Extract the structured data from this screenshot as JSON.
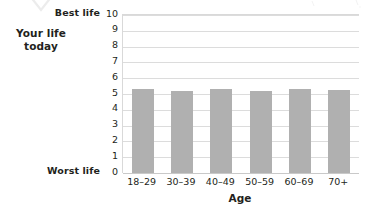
{
  "chart_data": {
    "type": "bar",
    "title": "",
    "categories": [
      "18–29",
      "30–39",
      "40–49",
      "50–59",
      "60–69",
      "70+"
    ],
    "values": [
      5.3,
      5.2,
      5.3,
      5.2,
      5.3,
      5.25
    ],
    "series": [
      {
        "name": "Your life today",
        "values": [
          5.3,
          5.2,
          5.3,
          5.2,
          5.3,
          5.25
        ]
      }
    ],
    "xlabel": "Age",
    "ylabel": "Your life today",
    "ylim": [
      0,
      10
    ],
    "ytick_labels": [
      "10",
      "9",
      "8",
      "7",
      "6",
      "5",
      "4",
      "3",
      "2",
      "1",
      "0"
    ],
    "ytick_values": [
      10,
      9,
      8,
      7,
      6,
      5,
      4,
      3,
      2,
      1,
      0
    ],
    "y_top_annotation": "Best life",
    "y_bottom_annotation": "Worst life",
    "grid": true,
    "legend": "none",
    "bar_color": "#b0b0b0",
    "grid_color": "#dcdcdc"
  },
  "axis": {
    "y_label_line1": "Your life",
    "y_label_line2": "today",
    "best_life": "Best life",
    "worst_life": "Worst life",
    "x_title": "Age"
  }
}
